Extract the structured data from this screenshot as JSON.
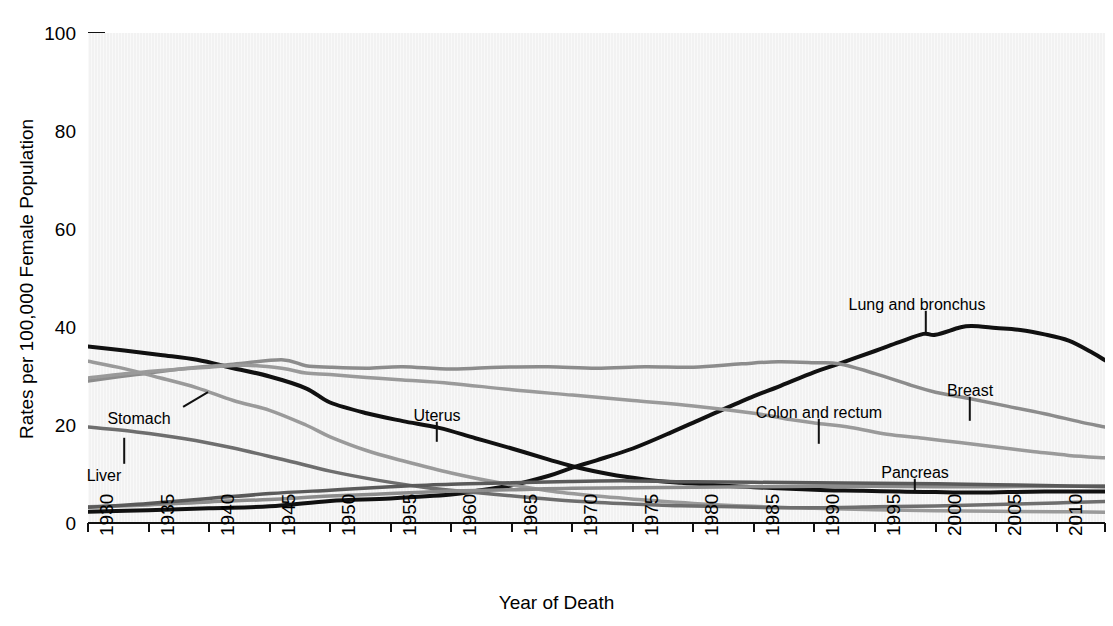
{
  "chart_data": {
    "type": "line",
    "title": "",
    "xlabel": "Year of Death",
    "ylabel": "Rates per 100,000 Female Population",
    "xlim": [
      1930,
      2014
    ],
    "ylim": [
      0,
      100
    ],
    "yticks": [
      0,
      20,
      40,
      60,
      80,
      100
    ],
    "xticks": [
      1930,
      1935,
      1940,
      1945,
      1950,
      1955,
      1960,
      1965,
      1970,
      1975,
      1980,
      1985,
      1990,
      1995,
      2000,
      2005,
      2010,
      2014
    ],
    "grid": false,
    "legend": "inline-annotations",
    "annotations": [
      {
        "name": "Lung and bronchus",
        "label_x": 917,
        "label_y": 296,
        "leader_from_x": 926,
        "leader_from_y": 310,
        "leader_to_x": 926,
        "leader_to_y": 333
      },
      {
        "name": "Breast",
        "label_x": 970,
        "label_y": 382,
        "leader_from_x": 970,
        "leader_from_y": 396,
        "leader_to_x": 970,
        "leader_to_y": 420
      },
      {
        "name": "Colon and rectum",
        "label_x": 819,
        "label_y": 404,
        "leader_from_x": 819,
        "leader_from_y": 418,
        "leader_to_x": 819,
        "leader_to_y": 443
      },
      {
        "name": "Pancreas",
        "label_x": 915,
        "label_y": 464,
        "leader_from_x": 915,
        "leader_from_y": 478,
        "leader_to_x": 915,
        "leader_to_y": 492
      },
      {
        "name": "Uterus",
        "label_x": 437,
        "label_y": 407,
        "leader_from_x": 437,
        "leader_from_y": 421,
        "leader_to_x": 437,
        "leader_to_y": 441
      },
      {
        "name": "Stomach",
        "label_x": 139,
        "label_y": 410,
        "leader_from_x": 183,
        "leader_from_y": 406,
        "leader_to_x": 208,
        "leader_to_y": 391
      },
      {
        "name": "Liver",
        "label_x": 104,
        "label_y": 467,
        "leader_from_x": 124,
        "leader_from_y": 463,
        "leader_to_x": 124,
        "leader_to_y": 437
      }
    ],
    "series": [
      {
        "name": "Lung and bronchus",
        "color": "#111111",
        "width": 4.0,
        "x": [
          1930,
          1935,
          1940,
          1945,
          1950,
          1955,
          1960,
          1962,
          1965,
          1968,
          1970,
          1972,
          1975,
          1978,
          1980,
          1982,
          1985,
          1987,
          1990,
          1992,
          1995,
          1997,
          1999,
          2000,
          2002,
          2003,
          2005,
          2007,
          2009,
          2011,
          2013,
          2014
        ],
        "y": [
          2.3,
          2.6,
          3.0,
          3.4,
          4.5,
          5.0,
          5.8,
          6.5,
          7.7,
          9.6,
          11.3,
          12.8,
          15.2,
          18.3,
          20.5,
          22.7,
          25.9,
          27.8,
          30.8,
          32.5,
          35.1,
          36.9,
          38.6,
          38.4,
          39.9,
          40.2,
          39.8,
          39.4,
          38.5,
          37.2,
          34.7,
          33.2
        ]
      },
      {
        "name": "Uterus",
        "color": "#111111",
        "width": 4.0,
        "x": [
          1930,
          1933,
          1936,
          1939,
          1942,
          1945,
          1948,
          1950,
          1953,
          1956,
          1959,
          1962,
          1965,
          1968,
          1970,
          1973,
          1976,
          1979,
          1982,
          1985,
          1988,
          1991,
          1994,
          1997,
          2000,
          2003,
          2006,
          2009,
          2012,
          2014
        ],
        "y": [
          36.0,
          35.2,
          34.3,
          33.3,
          31.6,
          29.9,
          27.5,
          24.6,
          22.4,
          20.8,
          19.4,
          17.3,
          15.2,
          13.0,
          11.6,
          10.0,
          8.9,
          8.2,
          7.7,
          7.3,
          7.0,
          6.7,
          6.6,
          6.4,
          6.3,
          6.2,
          6.3,
          6.4,
          6.4,
          6.4
        ]
      },
      {
        "name": "Breast",
        "color": "#8c8c8c",
        "width": 3.5,
        "x": [
          1930,
          1934,
          1938,
          1942,
          1946,
          1948,
          1950,
          1953,
          1956,
          1960,
          1964,
          1968,
          1972,
          1976,
          1980,
          1984,
          1987,
          1990,
          1992,
          1995,
          1998,
          2000,
          2003,
          2006,
          2009,
          2012,
          2014
        ],
        "y": [
          29.0,
          30.3,
          31.5,
          32.4,
          33.3,
          32.1,
          31.8,
          31.6,
          31.9,
          31.4,
          31.8,
          31.9,
          31.6,
          31.9,
          31.8,
          32.5,
          32.9,
          32.7,
          32.5,
          30.5,
          28.1,
          26.7,
          25.3,
          23.8,
          22.3,
          20.6,
          19.6
        ]
      },
      {
        "name": "Stomach",
        "color": "#9a9a9a",
        "width": 3.5,
        "x": [
          1930,
          1933,
          1936,
          1939,
          1942,
          1945,
          1948,
          1950,
          1953,
          1956,
          1960,
          1964,
          1968,
          1972,
          1976,
          1980,
          1985,
          1990,
          1995,
          2000,
          2005,
          2010,
          2014
        ],
        "y": [
          33.0,
          31.5,
          29.6,
          27.6,
          25.0,
          23.0,
          20.0,
          17.6,
          14.8,
          12.7,
          10.2,
          8.2,
          6.6,
          5.5,
          4.7,
          4.0,
          3.4,
          3.0,
          2.7,
          2.5,
          2.4,
          2.3,
          2.2
        ]
      },
      {
        "name": "Colon and rectum",
        "color": "#9a9a9a",
        "width": 3.5,
        "x": [
          1930,
          1935,
          1940,
          1943,
          1946,
          1948,
          1950,
          1953,
          1956,
          1960,
          1965,
          1970,
          1975,
          1980,
          1985,
          1988,
          1990,
          1993,
          1996,
          1999,
          2002,
          2005,
          2008,
          2011,
          2014
        ],
        "y": [
          29.6,
          30.9,
          31.8,
          32.2,
          31.6,
          30.6,
          30.3,
          29.7,
          29.2,
          28.5,
          27.2,
          26.1,
          25.0,
          23.9,
          22.4,
          21.1,
          20.4,
          19.5,
          18.1,
          17.3,
          16.4,
          15.5,
          14.6,
          13.8,
          13.3
        ]
      },
      {
        "name": "Liver",
        "color": "#6e6e6e",
        "width": 3.5,
        "x": [
          1930,
          1934,
          1938,
          1942,
          1946,
          1950,
          1954,
          1958,
          1962,
          1966,
          1970,
          1974,
          1978,
          1980,
          1985,
          1990,
          1995,
          2000,
          2005,
          2010,
          2014
        ],
        "y": [
          19.6,
          18.6,
          17.2,
          15.3,
          13.0,
          10.6,
          8.7,
          7.2,
          6.2,
          5.3,
          4.5,
          4.0,
          3.6,
          3.5,
          3.2,
          3.1,
          3.3,
          3.5,
          3.8,
          4.1,
          4.4
        ]
      },
      {
        "name": "Pancreas",
        "color": "#8c8c8c",
        "width": 3.5,
        "x": [
          1930,
          1935,
          1940,
          1945,
          1950,
          1955,
          1960,
          1965,
          1970,
          1975,
          1980,
          1985,
          1990,
          1995,
          2000,
          2005,
          2010,
          2014
        ],
        "y": [
          3.3,
          3.7,
          4.3,
          4.8,
          5.5,
          6.0,
          6.5,
          6.8,
          7.1,
          7.2,
          7.3,
          7.4,
          7.5,
          7.5,
          7.4,
          7.4,
          7.5,
          7.6
        ]
      },
      {
        "name": "Ovary",
        "color": "#5a5a5a",
        "width": 3.5,
        "x": [
          1930,
          1935,
          1940,
          1945,
          1950,
          1955,
          1960,
          1965,
          1970,
          1975,
          1980,
          1985,
          1990,
          1995,
          2000,
          2005,
          2010,
          2014
        ],
        "y": [
          3.2,
          4.0,
          5.0,
          6.0,
          6.7,
          7.4,
          7.9,
          8.2,
          8.5,
          8.6,
          8.4,
          8.3,
          8.2,
          8.1,
          8.0,
          7.8,
          7.6,
          7.4
        ]
      }
    ]
  },
  "axis": {
    "y_title": "Rates per 100,000 Female Population",
    "x_title": "Year of Death",
    "y_tick_labels": [
      "100",
      "80",
      "60",
      "40",
      "20",
      "0"
    ],
    "x_tick_labels": [
      "1930",
      "1935",
      "1940",
      "1945",
      "1950",
      "1955",
      "1960",
      "1965",
      "1970",
      "1975",
      "1980",
      "1985",
      "1990",
      "1995",
      "2000",
      "2005",
      "2010",
      "2014"
    ]
  },
  "labels": {
    "lung": "Lung and bronchus",
    "breast": "Breast",
    "colon": "Colon and rectum",
    "pancreas": "Pancreas",
    "uterus": "Uterus",
    "stomach": "Stomach",
    "liver": "Liver"
  }
}
